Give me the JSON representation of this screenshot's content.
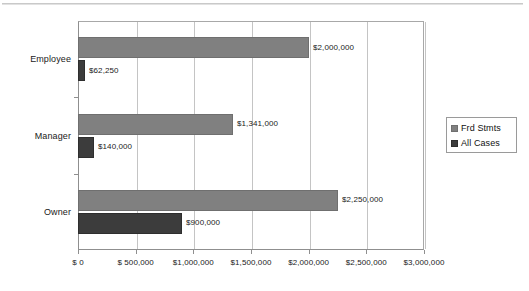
{
  "chart_data": {
    "type": "bar",
    "orientation": "horizontal",
    "title": "",
    "subtitle": "",
    "xlabel": "",
    "ylabel": "",
    "categories": [
      "Employee",
      "Manager",
      "Owner"
    ],
    "series": [
      {
        "name": "Frd Stmts",
        "color": "#808080",
        "values": [
          2000000,
          1341000,
          2250000
        ],
        "labels": [
          "$2,000,000",
          "$1,341,000",
          "$2,250,000"
        ]
      },
      {
        "name": "All Cases",
        "color": "#3c3c3c",
        "values": [
          62250,
          140000,
          900000
        ],
        "labels": [
          "$62,250",
          "$140,000",
          "$900,000"
        ]
      }
    ],
    "xlim": [
      0,
      3000000
    ],
    "xticks": [
      0,
      500000,
      1000000,
      1500000,
      2000000,
      2500000,
      3000000
    ],
    "xtick_labels": [
      "$ 0",
      "$ 500,000",
      "$1,000,000",
      "$1,500,000",
      "$2,000,000",
      "$2,500,000",
      "$3,000,000"
    ],
    "grid": true,
    "grid_axis": "x",
    "grid_color": "#c4c4c4",
    "legend_position": "right",
    "plot_border_color": "#8f8f8f",
    "background": "#ffffff"
  },
  "legend": {
    "items": [
      {
        "label": "Frd Stmts",
        "swatch": "legend-swatch-frd-stmts"
      },
      {
        "label": "All Cases",
        "swatch": "legend-swatch-all-cases"
      }
    ]
  }
}
